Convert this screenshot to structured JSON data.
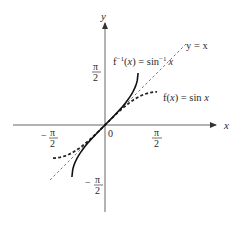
{
  "diagram": {
    "axes": {
      "x_label": "x",
      "y_label": "y",
      "origin_label": "0"
    },
    "ticks": {
      "x_pos": {
        "num": "π",
        "den": "2"
      },
      "x_neg": {
        "sign": "−",
        "num": "π",
        "den": "2"
      },
      "y_pos": {
        "num": "π",
        "den": "2"
      },
      "y_neg": {
        "sign": "−",
        "num": "π",
        "den": "2"
      }
    },
    "curves": [
      {
        "name": "identity",
        "label": "y = x",
        "style": "dashed-thin",
        "color": "#555555"
      },
      {
        "name": "sin",
        "label_prefix": "f(",
        "label_var": "x",
        "label_suffix": ") = sin ",
        "label_arg": "x",
        "style": "dashed-thick",
        "color": "#222222",
        "domain": "[-π/2, π/2]"
      },
      {
        "name": "arcsin",
        "label_prefix": "f",
        "label_sup": "−1",
        "label_mid": "(",
        "label_var": "x",
        "label_suffix": ") = sin",
        "label_sup2": "−1",
        "label_arg": "x",
        "style": "solid",
        "color": "#111111",
        "domain": "[-1, 1]"
      }
    ]
  }
}
